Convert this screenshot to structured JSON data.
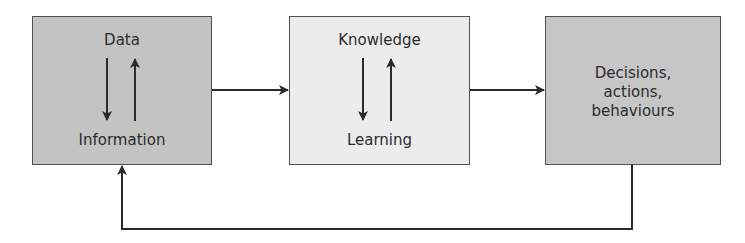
{
  "diagram": {
    "nodes": [
      {
        "id": "data-information",
        "top_label": "Data",
        "bottom_label": "Information",
        "fill": "#c3c3c3"
      },
      {
        "id": "knowledge-learning",
        "top_label": "Knowledge",
        "bottom_label": "Learning",
        "fill": "#ececec"
      },
      {
        "id": "decisions",
        "label_lines": [
          "Decisions,",
          "actions,",
          "behaviours"
        ],
        "fill": "#c6c6c6"
      }
    ],
    "edges": [
      {
        "from": "data-information",
        "to": "knowledge-learning"
      },
      {
        "from": "knowledge-learning",
        "to": "decisions"
      },
      {
        "from": "decisions",
        "to": "data-information",
        "type": "feedback"
      }
    ],
    "internal_arrows": [
      "down",
      "up"
    ]
  }
}
